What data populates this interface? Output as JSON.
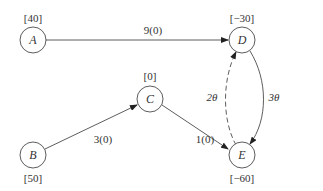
{
  "diagram": {
    "type": "network-flow-graph",
    "nodes": [
      {
        "id": "A",
        "label": "A",
        "supply": "[40]"
      },
      {
        "id": "B",
        "label": "B",
        "supply": "[50]"
      },
      {
        "id": "C",
        "label": "C",
        "supply": "[0]"
      },
      {
        "id": "D",
        "label": "D",
        "supply": "[−30]"
      },
      {
        "id": "E",
        "label": "E",
        "supply": "[−60]"
      }
    ],
    "edges": [
      {
        "from": "A",
        "to": "D",
        "label": "9(0)",
        "style": "solid"
      },
      {
        "from": "B",
        "to": "C",
        "label": "3(0)",
        "style": "solid"
      },
      {
        "from": "C",
        "to": "E",
        "label": "1(0)",
        "style": "solid"
      },
      {
        "from": "D",
        "to": "E",
        "label": "3θ",
        "style": "solid"
      },
      {
        "from": "E",
        "to": "D",
        "label": "2θ",
        "style": "dashed"
      }
    ]
  }
}
